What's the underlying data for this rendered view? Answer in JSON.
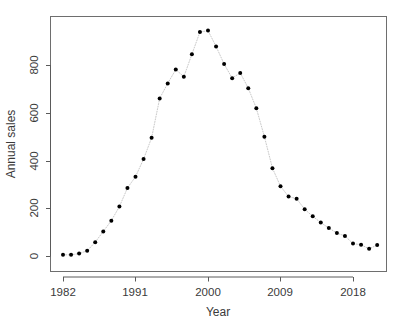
{
  "chart_data": {
    "type": "scatter",
    "title": "",
    "xlabel": "Year",
    "ylabel": "Annual sales",
    "xlim": [
      1981.0,
      1922.0
    ],
    "x_range": [
      1981.0,
      2021.8
    ],
    "ylim": [
      -20,
      980
    ],
    "grid": false,
    "legend": null,
    "point_style": "filled-circle",
    "line_style": "dotted",
    "line_color": "#c8c8c8",
    "point_color": "#000000",
    "axis_color": "#5a5a5a",
    "background": "#ffffff",
    "xticks": [
      1982,
      1991,
      2000,
      2009,
      2018
    ],
    "xtick_labels": [
      "1982",
      "1991",
      "2000",
      "2009",
      "2018"
    ],
    "yticks": [
      0,
      200,
      400,
      600,
      800
    ],
    "ytick_labels": [
      "0",
      "200",
      "400",
      "600",
      "800"
    ],
    "x": [
      1982,
      1983,
      1984,
      1985,
      1986,
      1987,
      1988,
      1989,
      1990,
      1991,
      1992,
      1993,
      1994,
      1995,
      1996,
      1997,
      1998,
      1999,
      2000,
      2001,
      2002,
      2003,
      2004,
      2005,
      2006,
      2007,
      2008,
      2009,
      2010,
      2011,
      2012,
      2013,
      2014,
      2015,
      2016,
      2017,
      2018,
      2019,
      2020,
      2021
    ],
    "values": [
      5,
      5,
      10,
      22,
      58,
      103,
      148,
      207,
      285,
      332,
      406,
      495,
      660,
      723,
      781,
      751,
      845,
      938,
      944,
      878,
      804,
      745,
      767,
      703,
      619,
      500,
      368,
      292,
      249,
      240,
      196,
      166,
      140,
      117,
      96,
      84,
      52,
      47,
      30,
      46
    ],
    "series": [
      {
        "name": "Annual sales",
        "values": [
          5,
          5,
          10,
          22,
          58,
          103,
          148,
          207,
          285,
          332,
          406,
          495,
          660,
          723,
          781,
          751,
          845,
          938,
          944,
          878,
          804,
          745,
          767,
          703,
          619,
          500,
          368,
          292,
          249,
          240,
          196,
          166,
          140,
          117,
          96,
          84,
          52,
          47,
          30,
          46
        ]
      }
    ]
  }
}
